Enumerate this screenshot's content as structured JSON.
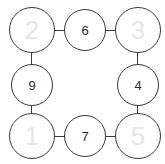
{
  "diagram": {
    "type": "ring-graph",
    "stroke_color": "#3a3a3a",
    "background_color": "#ffffff",
    "filled_text_color": "#2b2b2b",
    "faint_text_color": "#e6e6e6",
    "nodes": [
      {
        "id": "top-left",
        "value": "2",
        "faint": true,
        "row": "top",
        "col": "left"
      },
      {
        "id": "top-middle",
        "value": "6",
        "faint": false,
        "row": "top",
        "col": "middle"
      },
      {
        "id": "top-right",
        "value": "3",
        "faint": true,
        "row": "top",
        "col": "right"
      },
      {
        "id": "middle-left",
        "value": "9",
        "faint": false,
        "row": "middle",
        "col": "left"
      },
      {
        "id": "middle-right",
        "value": "4",
        "faint": false,
        "row": "middle",
        "col": "right"
      },
      {
        "id": "bottom-left",
        "value": "1",
        "faint": true,
        "row": "bottom",
        "col": "left"
      },
      {
        "id": "bottom-middle",
        "value": "7",
        "faint": false,
        "row": "bottom",
        "col": "middle"
      },
      {
        "id": "bottom-right",
        "value": "5",
        "faint": true,
        "row": "bottom",
        "col": "right"
      }
    ],
    "edges": [
      {
        "id": "top-left--top-middle",
        "from": "top-left",
        "to": "top-middle",
        "orientation": "horizontal"
      },
      {
        "id": "top-middle--top-right",
        "from": "top-middle",
        "to": "top-right",
        "orientation": "horizontal"
      },
      {
        "id": "top-left--middle-left",
        "from": "top-left",
        "to": "middle-left",
        "orientation": "vertical"
      },
      {
        "id": "top-right--middle-right",
        "from": "top-right",
        "to": "middle-right",
        "orientation": "vertical"
      },
      {
        "id": "middle-left--bottom-left",
        "from": "middle-left",
        "to": "bottom-left",
        "orientation": "vertical"
      },
      {
        "id": "middle-right--bottom-right",
        "from": "middle-right",
        "to": "bottom-right",
        "orientation": "vertical"
      },
      {
        "id": "bottom-left--bottom-middle",
        "from": "bottom-left",
        "to": "bottom-middle",
        "orientation": "horizontal"
      },
      {
        "id": "bottom-middle--bottom-right",
        "from": "bottom-middle",
        "to": "bottom-right",
        "orientation": "horizontal"
      }
    ]
  }
}
